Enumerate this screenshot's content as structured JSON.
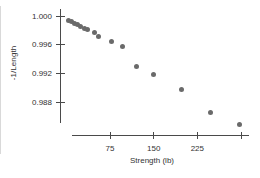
{
  "figure": {
    "background": "#ffffff",
    "left_edge_color": "#d9d9d9"
  },
  "chart_data": {
    "type": "scatter",
    "title": "",
    "xlabel": "Strength (lb)",
    "ylabel": "-1/Length",
    "x_ticks": [
      {
        "value": 75,
        "label": "75"
      },
      {
        "value": 150,
        "label": "150"
      },
      {
        "value": 225,
        "label": "225"
      },
      {
        "value": 300,
        "label": ""
      }
    ],
    "y_ticks": [
      {
        "value": 1.0,
        "label": "1.000"
      },
      {
        "value": 0.996,
        "label": "0.996"
      },
      {
        "value": 0.992,
        "label": "0.992"
      },
      {
        "value": 0.988,
        "label": "0.988"
      }
    ],
    "xlim": [
      -12,
      310
    ],
    "ylim": [
      0.9838,
      1.0008
    ],
    "grid": false,
    "legend": null,
    "marker": {
      "shape": "circle",
      "size_px": 5,
      "color": "#6a6a6a"
    },
    "axis_color": "#4a4a4a",
    "text_color": "#333333",
    "points": [
      {
        "x": 3,
        "y": 0.9994
      },
      {
        "x": 9,
        "y": 0.9992
      },
      {
        "x": 14,
        "y": 0.999
      },
      {
        "x": 20,
        "y": 0.9988
      },
      {
        "x": 25,
        "y": 0.9985
      },
      {
        "x": 31,
        "y": 0.9983
      },
      {
        "x": 36,
        "y": 0.9981
      },
      {
        "x": 48,
        "y": 0.9977
      },
      {
        "x": 56,
        "y": 0.9972
      },
      {
        "x": 78,
        "y": 0.9964
      },
      {
        "x": 97,
        "y": 0.9957
      },
      {
        "x": 121,
        "y": 0.9929
      },
      {
        "x": 149,
        "y": 0.9918
      },
      {
        "x": 197,
        "y": 0.9898
      },
      {
        "x": 248,
        "y": 0.9865
      },
      {
        "x": 297,
        "y": 0.9849
      }
    ]
  }
}
